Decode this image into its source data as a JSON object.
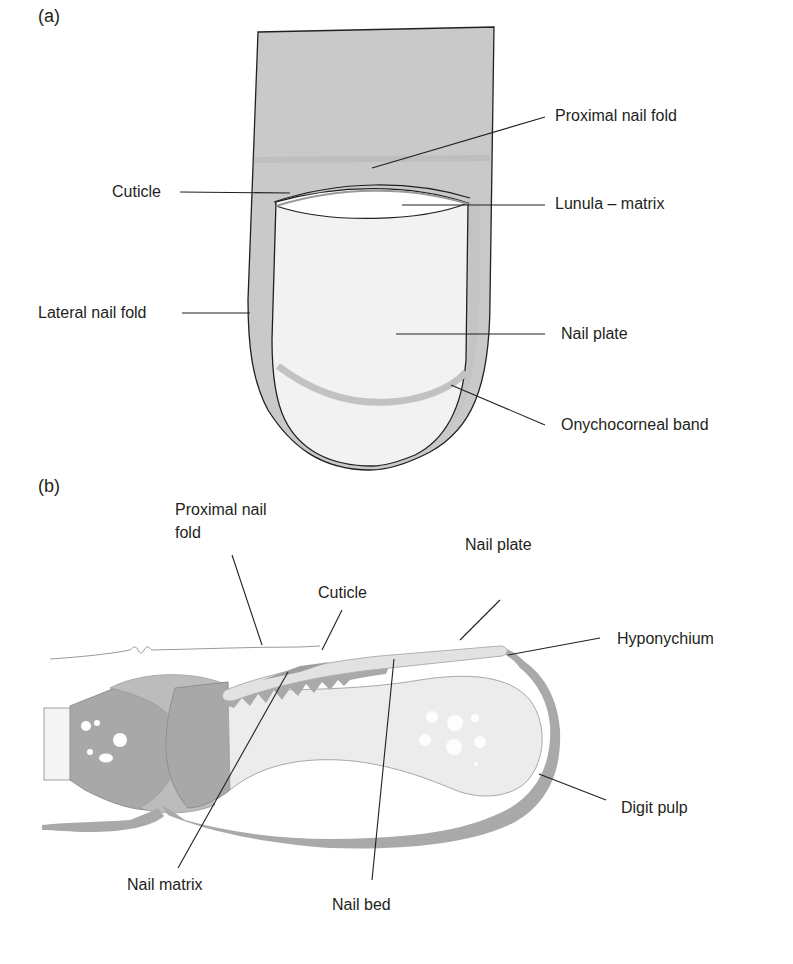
{
  "figure": {
    "panel_a": {
      "label": "(a)",
      "title": "Nail unit — dorsal view",
      "labels": {
        "proximal_nail_fold": "Proximal nail fold",
        "cuticle": "Cuticle",
        "lunula_matrix": "Lunula – matrix",
        "lateral_nail_fold": "Lateral nail fold",
        "nail_plate": "Nail plate",
        "onychocorneal_band": "Onychocorneal band"
      }
    },
    "panel_b": {
      "label": "(b)",
      "title": "Nail unit — longitudinal section",
      "labels": {
        "proximal_nail_fold_line1": "Proximal nail",
        "proximal_nail_fold_line2": "fold",
        "cuticle": "Cuticle",
        "nail_plate": "Nail plate",
        "hyponychium": "Hyponychium",
        "digit_pulp": "Digit pulp",
        "nail_matrix": "Nail matrix",
        "nail_bed": "Nail bed"
      }
    },
    "colors": {
      "skin_gray": "#c8c8c8",
      "nail_fill": "#f3f3f3",
      "band_gray": "#c4c4c4",
      "epithelium_gray": "#a9a9a9",
      "bone_dark": "#a6a6a6",
      "bone_mid": "#bdbdbd",
      "bone_light": "#ececec",
      "line": "#231f20"
    }
  }
}
